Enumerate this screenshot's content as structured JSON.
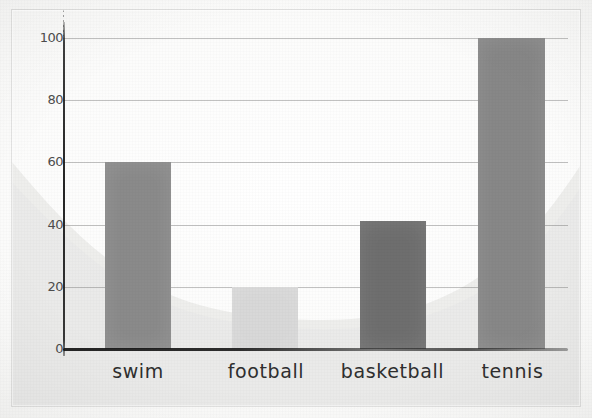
{
  "chart_data": {
    "type": "bar",
    "title": "",
    "subtitle": "",
    "xlabel": "",
    "ylabel": "",
    "categories": [
      "swim",
      "football",
      "basketball",
      "tennis"
    ],
    "values": [
      60,
      20,
      41,
      100
    ],
    "series": [
      {
        "name": "count",
        "values": [
          60,
          20,
          41,
          100
        ]
      }
    ],
    "bar_colors": [
      "#8a8a8a",
      "#d8d8d8",
      "#6e6e6e",
      "#878787"
    ],
    "ylim": [
      0,
      100
    ],
    "yticks": [
      0,
      20,
      40,
      60,
      80,
      100
    ],
    "ytick_labels": [
      "0",
      "20",
      "40",
      "60",
      "80",
      "100"
    ],
    "grid": true,
    "legend": false,
    "legend_position": "none",
    "annotations": []
  },
  "axes": {
    "y_ticks": [
      {
        "label": "100",
        "value": 100
      },
      {
        "label": "80",
        "value": 80
      },
      {
        "label": "60",
        "value": 60
      },
      {
        "label": "40",
        "value": 40
      },
      {
        "label": "20",
        "value": 20
      },
      {
        "label": "0",
        "value": 0
      }
    ],
    "x_categories": [
      {
        "label": "swim"
      },
      {
        "label": "football"
      },
      {
        "label": "basketball"
      },
      {
        "label": "tennis"
      }
    ]
  },
  "style": {
    "background": "#f7f7f5",
    "gridline_color": "#6e6e6e",
    "axis_color": "#1e1e1e",
    "tick_text_color": "#4d4d4d",
    "category_text_color": "#2f2f2f",
    "watermark_color": "#ededeb"
  }
}
